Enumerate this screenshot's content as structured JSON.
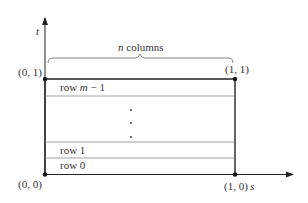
{
  "diagram": {
    "axes": {
      "vertical_label": "t",
      "horizontal_label": "s"
    },
    "brace_label_var": "n",
    "brace_label_text": " columns",
    "corners": {
      "top_left": "(0, 1)",
      "top_right": "(1, 1)",
      "bottom_left": "(0, 0)",
      "bottom_right": "(1, 0)"
    },
    "rows": {
      "top_prefix": "row ",
      "top_var": "m",
      "top_suffix": " − 1",
      "row1": "row 1",
      "row0": "row 0"
    },
    "colors": {
      "stroke": "#222222",
      "thin_stroke": "#888888",
      "text": "#333333"
    }
  }
}
